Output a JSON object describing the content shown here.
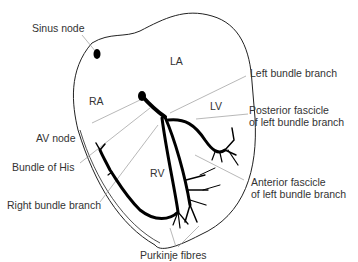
{
  "diagram": {
    "chambers": [
      {
        "id": "LA",
        "label": "LA"
      },
      {
        "id": "RA",
        "label": "RA"
      },
      {
        "id": "LV",
        "label": "LV"
      },
      {
        "id": "RV",
        "label": "RV"
      }
    ],
    "labels": {
      "sinus_node": "Sinus node",
      "av_node": "AV node",
      "bundle_of_his": "Bundle of His",
      "right_bundle_branch": "Right bundle branch",
      "left_bundle_branch": "Left bundle branch",
      "posterior_fascicle_1": "Posterior fascicle",
      "posterior_fascicle_2": "of left bundle branch",
      "anterior_fascicle_1": "Anterior fascicle",
      "anterior_fascicle_2": "of left bundle branch",
      "purkinje_fibres": "Purkinje fibres"
    },
    "colors": {
      "outline": "#222222",
      "conduction": "#000000",
      "leader": "#888888",
      "text": "#333333"
    }
  }
}
